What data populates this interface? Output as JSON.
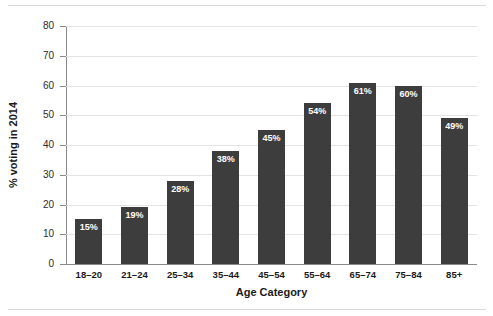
{
  "chart_data": {
    "type": "bar",
    "title": "",
    "subtitle": "",
    "xlabel": "Age Category",
    "ylabel": "% voting in 2014",
    "categories": [
      "18–20",
      "21–24",
      "25–34",
      "35–44",
      "45–54",
      "55–64",
      "65–74",
      "75–84",
      "85+"
    ],
    "values": [
      15,
      19,
      28,
      38,
      45,
      54,
      61,
      60,
      49
    ],
    "data_labels": [
      "15%",
      "19%",
      "28%",
      "38%",
      "45%",
      "54%",
      "61%",
      "60%",
      "49%"
    ],
    "ylim": [
      0,
      80
    ],
    "yticks": [
      0,
      10,
      20,
      30,
      40,
      50,
      60,
      70,
      80
    ],
    "ytick_labels": [
      "0",
      "10",
      "20",
      "30",
      "40",
      "50",
      "60",
      "70",
      "80"
    ],
    "grid": true,
    "grid_axis": "y",
    "legend": false,
    "legend_position": "none",
    "bar_color": "#3d3d3d",
    "data_label_color": "#ffffff",
    "gridline_color": "#e3e3e3",
    "axis_color": "#8a8a8a",
    "background_color": "#ffffff"
  }
}
